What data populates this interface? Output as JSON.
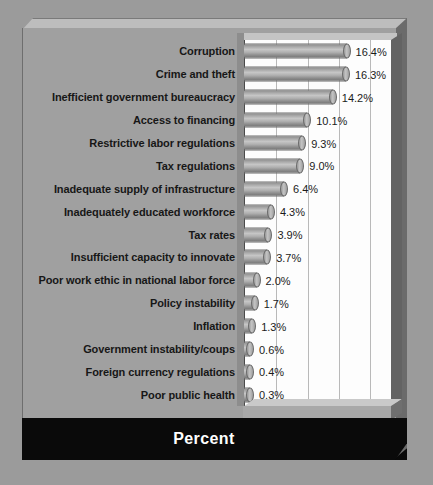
{
  "chart_data": {
    "type": "bar",
    "orientation": "horizontal",
    "title": "",
    "xlabel": "Percent",
    "ylabel": "",
    "xlim": [
      0,
      23.5
    ],
    "xticks": [
      0,
      5,
      10,
      15,
      20
    ],
    "grid": true,
    "legend": null,
    "categories": [
      "Corruption",
      "Crime and theft",
      "Inefficient government bureaucracy",
      "Access to financing",
      "Restrictive labor regulations",
      "Tax regulations",
      "Inadequate supply of infrastructure",
      "Inadequately educated workforce",
      "Tax rates",
      "Insufficient capacity to innovate",
      "Poor work ethic in national labor force",
      "Policy instability",
      "Inflation",
      "Government instability/coups",
      "Foreign currency regulations",
      "Poor public health"
    ],
    "values": [
      16.4,
      16.3,
      14.2,
      10.1,
      9.3,
      9.0,
      6.4,
      4.3,
      3.9,
      3.7,
      2.0,
      1.7,
      1.3,
      0.6,
      0.4,
      0.3
    ],
    "value_labels": [
      "16.4%",
      "16.3%",
      "14.2%",
      "10.1%",
      "9.3%",
      "9.0%",
      "6.4%",
      "4.3%",
      "3.9%",
      "3.7%",
      "2.0%",
      "1.7%",
      "1.3%",
      "0.6%",
      "0.4%",
      "0.3%"
    ],
    "bar_style": "3d-cylinder",
    "colors": {
      "background": "#9b9b9b",
      "panel": "#a0a0a0",
      "plot_background": "#fdfdfd",
      "bar_fill": "#b0b0b0",
      "gridline": "#b9b9b9",
      "label_text": "#171717",
      "footer_band": "#090909",
      "footer_text": "#ffffff"
    }
  },
  "axis": {
    "tick_labels": [
      "0",
      "5",
      "10",
      "15",
      "20"
    ]
  },
  "footer": {
    "axis_title": "Percent"
  }
}
